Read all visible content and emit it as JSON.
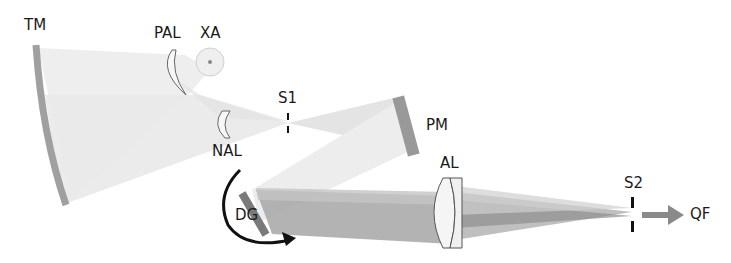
{
  "diagram": {
    "type": "optical-spectrometer-layout",
    "components": [
      {
        "id": "TM",
        "label": "TM",
        "kind": "toroidal-mirror"
      },
      {
        "id": "PAL",
        "label": "PAL",
        "kind": "positive-achromatic-lens"
      },
      {
        "id": "XA",
        "label": "XA",
        "kind": "source-aperture"
      },
      {
        "id": "NAL",
        "label": "NAL",
        "kind": "negative-achromatic-lens"
      },
      {
        "id": "S1",
        "label": "S1",
        "kind": "slit"
      },
      {
        "id": "PM",
        "label": "PM",
        "kind": "plane-mirror"
      },
      {
        "id": "DG",
        "label": "DG",
        "kind": "diffraction-grating"
      },
      {
        "id": "AL",
        "label": "AL",
        "kind": "achromatic-lens"
      },
      {
        "id": "S2",
        "label": "S2",
        "kind": "exit-slit"
      },
      {
        "id": "QF",
        "label": "QF",
        "kind": "output-fiber"
      }
    ],
    "colors": {
      "mirror": "#a0a0a0",
      "beam_light": "#ececec",
      "beam_mid": "#d6d6d6",
      "beam_dark": "#9a9a9a",
      "lens_stroke": "#555555",
      "arrow": "#111111",
      "output_arrow": "#8a8a8a"
    }
  }
}
